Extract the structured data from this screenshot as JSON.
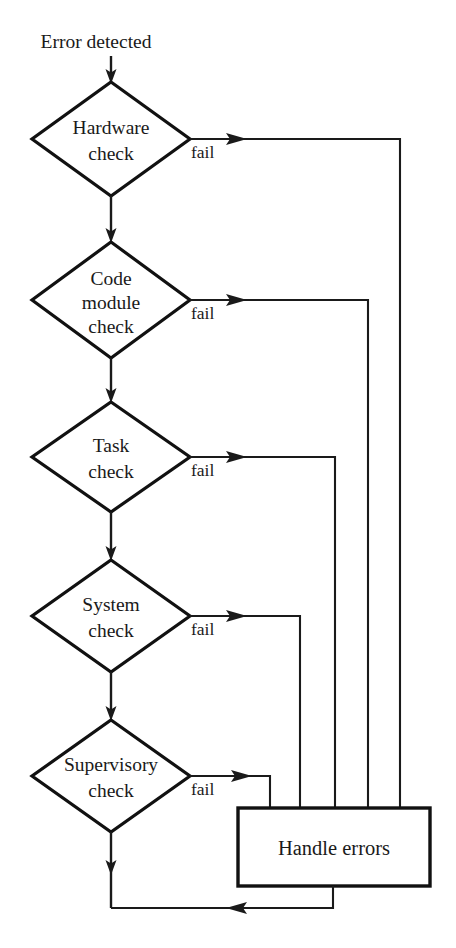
{
  "diagram": {
    "type": "flowchart",
    "background_color": "#ffffff",
    "line_color": "#1a1a1a",
    "text_color": "#1a1a1a",
    "entry": {
      "label": "Error detected"
    },
    "decisions": [
      {
        "id": "hardware",
        "label_line1": "Hardware",
        "label_line2": "check",
        "fail_label": "fail",
        "cx": 111,
        "cy": 139,
        "rx": 79,
        "ry": 57,
        "branch_x": 400
      },
      {
        "id": "code-module",
        "label_line1": "Code",
        "label_line2": "module",
        "label_line3": "check",
        "fail_label": "fail",
        "cx": 111,
        "cy": 300,
        "rx": 79,
        "ry": 58,
        "branch_x": 368
      },
      {
        "id": "task",
        "label_line1": "Task",
        "label_line2": "check",
        "fail_label": "fail",
        "cx": 111,
        "cy": 457,
        "rx": 79,
        "ry": 55,
        "branch_x": 335
      },
      {
        "id": "system",
        "label_line1": "System",
        "label_line2": "check",
        "fail_label": "fail",
        "cx": 111,
        "cy": 616,
        "rx": 79,
        "ry": 56,
        "branch_x": 300
      },
      {
        "id": "supervisory",
        "label_line1": "Supervisory",
        "label_line2": "check",
        "fail_label": "fail",
        "cx": 111,
        "cy": 776,
        "rx": 79,
        "ry": 56,
        "branch_x": 270
      }
    ],
    "process": {
      "id": "handle-errors",
      "label": "Handle errors",
      "x": 238,
      "y": 808,
      "width": 192,
      "height": 78
    },
    "feedback": {
      "from_x": 333,
      "y": 908,
      "to_x": 111
    }
  }
}
